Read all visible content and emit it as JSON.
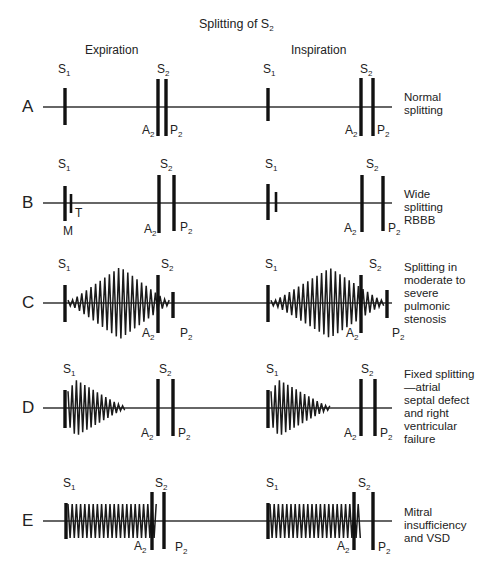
{
  "title": {
    "text": "Splitting of S",
    "sub": "2"
  },
  "phases": [
    {
      "label": "Expiration",
      "x": 85,
      "y": 44
    },
    {
      "label": "Inspiration",
      "x": 291,
      "y": 44
    }
  ],
  "baseline": {
    "x_start": 43,
    "x_end": 392,
    "color": "#333333"
  },
  "rows": [
    {
      "id": "A",
      "y": 107,
      "desc": "Normal\nsplitting",
      "bars": [
        {
          "x": 65,
          "top": 88,
          "bottom": 125,
          "label": "S",
          "sub": "1",
          "lx": 58,
          "ly": 63
        },
        {
          "x": 158,
          "top": 79,
          "bottom": 136,
          "label": "A",
          "sub": "2",
          "lx": 142,
          "ly": 124
        },
        {
          "x": 166,
          "top": 79,
          "bottom": 136,
          "label": "P",
          "sub": "2",
          "lx": 170,
          "ly": 124
        },
        {
          "x": 268,
          "top": 88,
          "bottom": 121,
          "label": "S",
          "sub": "1",
          "lx": 263,
          "ly": 63
        },
        {
          "x": 361,
          "top": 78,
          "bottom": 136,
          "label": "A",
          "sub": "2",
          "lx": 345,
          "ly": 124
        },
        {
          "x": 373,
          "top": 78,
          "bottom": 136,
          "label": "P",
          "sub": "2",
          "lx": 377,
          "ly": 124
        }
      ],
      "s2_labels": [
        {
          "x": 157,
          "y": 63
        },
        {
          "x": 360,
          "y": 63
        }
      ],
      "murmurs": []
    },
    {
      "id": "B",
      "y": 203,
      "desc": "Wide\nsplitting\nRBBB",
      "bars": [
        {
          "x": 65,
          "top": 186,
          "bottom": 221,
          "label": "S",
          "sub": "1",
          "lx": 58,
          "ly": 158
        },
        {
          "x": 71,
          "top": 194,
          "bottom": 213,
          "label": "T",
          "sub": "",
          "lx": 75,
          "ly": 207,
          "thin": true
        },
        {
          "x": 159,
          "top": 175,
          "bottom": 233,
          "label": "A",
          "sub": "2",
          "lx": 144,
          "ly": 223
        },
        {
          "x": 174,
          "top": 175,
          "bottom": 231,
          "label": "P",
          "sub": "2",
          "lx": 180,
          "ly": 221
        },
        {
          "x": 268,
          "top": 184,
          "bottom": 220,
          "label": "S",
          "sub": "1",
          "lx": 265,
          "ly": 158
        },
        {
          "x": 276,
          "top": 192,
          "bottom": 212,
          "label": "",
          "sub": "",
          "lx": 0,
          "ly": 0,
          "thin": true
        },
        {
          "x": 362,
          "top": 175,
          "bottom": 232,
          "label": "A",
          "sub": "2",
          "lx": 344,
          "ly": 222
        },
        {
          "x": 383,
          "top": 176,
          "bottom": 231,
          "label": "P",
          "sub": "2",
          "lx": 388,
          "ly": 222
        }
      ],
      "extra_labels": [
        {
          "text": "M",
          "x": 63,
          "y": 225
        }
      ],
      "s2_labels": [
        {
          "x": 160,
          "y": 158
        },
        {
          "x": 366,
          "y": 158
        }
      ],
      "murmurs": []
    },
    {
      "id": "C",
      "y": 303,
      "desc": "Splitting in\nmoderate to\nsevere\npulmonic\nstenosis",
      "bars": [
        {
          "x": 65,
          "top": 285,
          "bottom": 322,
          "label": "S",
          "sub": "1",
          "lx": 58,
          "ly": 258
        },
        {
          "x": 158,
          "top": 275,
          "bottom": 333,
          "label": "A",
          "sub": "2",
          "lx": 142,
          "ly": 327
        },
        {
          "x": 173,
          "top": 292,
          "bottom": 318,
          "label": "P",
          "sub": "2",
          "lx": 180,
          "ly": 327
        },
        {
          "x": 268,
          "top": 285,
          "bottom": 322,
          "label": "S",
          "sub": "1",
          "lx": 265,
          "ly": 258
        },
        {
          "x": 361,
          "top": 275,
          "bottom": 333,
          "label": "A",
          "sub": "2",
          "lx": 346,
          "ly": 327
        },
        {
          "x": 387,
          "top": 290,
          "bottom": 318,
          "label": "P",
          "sub": "2",
          "lx": 392,
          "ly": 327
        }
      ],
      "s2_labels": [
        {
          "x": 161,
          "y": 258
        },
        {
          "x": 369,
          "y": 258
        }
      ],
      "murmurs": [
        {
          "type": "diamond",
          "x_start": 68,
          "x_peak": 120,
          "x_end": 170,
          "amp": 36,
          "period": 4.6
        },
        {
          "type": "diamond",
          "x_start": 271,
          "x_peak": 330,
          "x_end": 385,
          "amp": 35,
          "period": 4.6
        }
      ]
    },
    {
      "id": "D",
      "y": 408,
      "desc": "Fixed splitting\n—atrial\nseptal defect\nand right\nventricular\nfailure",
      "bars": [
        {
          "x": 65,
          "top": 390,
          "bottom": 428,
          "label": "S",
          "sub": "1",
          "lx": 63,
          "ly": 363
        },
        {
          "x": 158,
          "top": 379,
          "bottom": 436,
          "label": "A",
          "sub": "2",
          "lx": 141,
          "ly": 427
        },
        {
          "x": 173,
          "top": 379,
          "bottom": 436,
          "label": "P",
          "sub": "2",
          "lx": 178,
          "ly": 427
        },
        {
          "x": 268,
          "top": 390,
          "bottom": 428,
          "label": "S",
          "sub": "1",
          "lx": 266,
          "ly": 363
        },
        {
          "x": 361,
          "top": 379,
          "bottom": 436,
          "label": "A",
          "sub": "2",
          "lx": 344,
          "ly": 427
        },
        {
          "x": 375,
          "top": 379,
          "bottom": 436,
          "label": "P",
          "sub": "2",
          "lx": 380,
          "ly": 427
        }
      ],
      "s2_labels": [
        {
          "x": 159,
          "y": 363
        },
        {
          "x": 361,
          "y": 363
        }
      ],
      "murmurs": [
        {
          "type": "decrescendo",
          "x_start": 68,
          "x_peak": 76,
          "x_end": 125,
          "amp": 28,
          "period": 4.2
        },
        {
          "type": "decrescendo",
          "x_start": 271,
          "x_peak": 279,
          "x_end": 330,
          "amp": 28,
          "period": 4.2
        }
      ]
    },
    {
      "id": "E",
      "y": 521,
      "desc": "Mitral\ninsufficiency\nand VSD",
      "bars": [
        {
          "x": 66,
          "top": 503,
          "bottom": 539,
          "label": "S",
          "sub": "1",
          "lx": 63,
          "ly": 477
        },
        {
          "x": 152,
          "top": 492,
          "bottom": 550,
          "label": "A",
          "sub": "2",
          "lx": 134,
          "ly": 540
        },
        {
          "x": 164,
          "top": 492,
          "bottom": 549,
          "label": "P",
          "sub": "2",
          "lx": 175,
          "ly": 541
        },
        {
          "x": 268,
          "top": 503,
          "bottom": 539,
          "label": "S",
          "sub": "1",
          "lx": 266,
          "ly": 477
        },
        {
          "x": 354,
          "top": 492,
          "bottom": 550,
          "label": "A",
          "sub": "2",
          "lx": 337,
          "ly": 540
        },
        {
          "x": 373,
          "top": 492,
          "bottom": 550,
          "label": "P",
          "sub": "2",
          "lx": 378,
          "ly": 541
        }
      ],
      "s2_labels": [
        {
          "x": 155,
          "y": 477
        },
        {
          "x": 358,
          "y": 477
        }
      ],
      "murmurs": [
        {
          "type": "plateau",
          "x_start": 68,
          "x_end": 158,
          "amp": 17,
          "period": 4.2
        },
        {
          "type": "plateau",
          "x_start": 270,
          "x_end": 362,
          "amp": 17,
          "period": 4.2
        }
      ]
    }
  ],
  "desc_x": 404,
  "desc_offsets": {
    "A": -16,
    "B": -15,
    "C": -42,
    "D": -40,
    "E": -15
  }
}
